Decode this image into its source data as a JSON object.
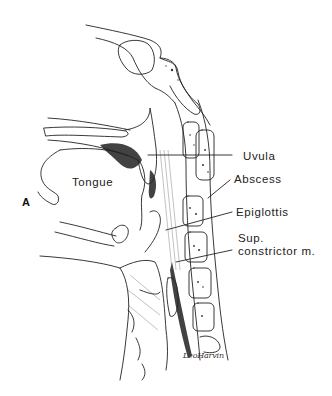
{
  "figure": {
    "panel_letter": "A",
    "labels": {
      "uvula": "Uvula",
      "abscess": "Abscess",
      "epiglottis": "Epiglottis",
      "sup_constrictor_line1": "Sup.",
      "sup_constrictor_line2": "constrictor  m.",
      "tongue": "Tongue"
    },
    "signature": "LeoHarvin"
  }
}
